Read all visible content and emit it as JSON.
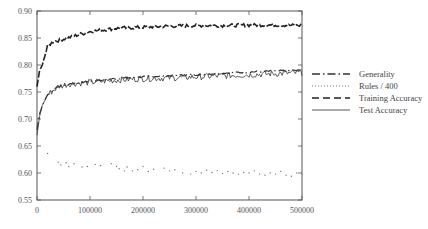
{
  "chart_data": {
    "type": "line",
    "title": "",
    "xlabel": "",
    "ylabel": "",
    "xlim": [
      0,
      500000
    ],
    "ylim": [
      0.55,
      0.9
    ],
    "grid": false,
    "legend_position": "right-outside",
    "x_ticks": [
      0,
      100000,
      200000,
      300000,
      400000,
      500000
    ],
    "x_tick_labels": [
      "0",
      "100000",
      "200000",
      "300000",
      "400000",
      "500000"
    ],
    "y_ticks": [
      0.55,
      0.6,
      0.65,
      0.7,
      0.75,
      0.8,
      0.85,
      0.9
    ],
    "y_tick_labels": [
      "0.55",
      "0.60",
      "0.65",
      "0.70",
      "0.75",
      "0.80",
      "0.85",
      "0.90"
    ],
    "series": [
      {
        "name": "Generality",
        "style": "dash-dot",
        "x": [
          0,
          5000,
          10000,
          20000,
          40000,
          60000,
          100000,
          150000,
          200000,
          250000,
          300000,
          350000,
          400000,
          450000,
          500000
        ],
        "values": [
          0.68,
          0.71,
          0.725,
          0.745,
          0.76,
          0.765,
          0.77,
          0.775,
          0.778,
          0.78,
          0.782,
          0.785,
          0.787,
          0.789,
          0.79
        ]
      },
      {
        "name": "Rules / 400",
        "style": "dotted",
        "x": [
          20000,
          40000,
          45000,
          55000,
          60000,
          70000,
          85000,
          95000,
          110000,
          120000,
          140000,
          150000,
          155000,
          165000,
          170000,
          180000,
          190000,
          200000,
          210000,
          220000,
          240000,
          250000,
          260000,
          275000,
          290000,
          300000,
          310000,
          320000,
          330000,
          340000,
          350000,
          360000,
          370000,
          380000,
          390000,
          400000,
          410000,
          420000,
          430000,
          440000,
          450000,
          460000,
          470000,
          480000,
          490000,
          500000
        ],
        "values": [
          0.636,
          0.62,
          0.615,
          0.619,
          0.612,
          0.617,
          0.611,
          0.612,
          0.616,
          0.614,
          0.617,
          0.612,
          0.608,
          0.604,
          0.611,
          0.604,
          0.606,
          0.612,
          0.603,
          0.607,
          0.609,
          0.604,
          0.606,
          0.6,
          0.598,
          0.603,
          0.6,
          0.605,
          0.601,
          0.604,
          0.599,
          0.603,
          0.6,
          0.598,
          0.601,
          0.6,
          0.604,
          0.598,
          0.596,
          0.6,
          0.598,
          0.603,
          0.596,
          0.594,
          0.6,
          0.598
        ]
      },
      {
        "name": "Training Accuracy",
        "style": "long-dash",
        "x": [
          0,
          5000,
          10000,
          20000,
          30000,
          50000,
          75000,
          100000,
          150000,
          200000,
          250000,
          300000,
          350000,
          400000,
          450000,
          500000
        ],
        "values": [
          0.76,
          0.79,
          0.8,
          0.835,
          0.843,
          0.848,
          0.855,
          0.862,
          0.868,
          0.87,
          0.872,
          0.873,
          0.873,
          0.874,
          0.874,
          0.873
        ]
      },
      {
        "name": "Test Accuracy",
        "style": "solid",
        "x": [
          0,
          5000,
          10000,
          20000,
          40000,
          60000,
          100000,
          150000,
          200000,
          250000,
          300000,
          350000,
          400000,
          450000,
          500000
        ],
        "values": [
          0.67,
          0.705,
          0.725,
          0.745,
          0.76,
          0.765,
          0.768,
          0.772,
          0.775,
          0.776,
          0.778,
          0.78,
          0.782,
          0.784,
          0.786
        ]
      }
    ]
  },
  "legend": {
    "items": [
      {
        "label": "Generality"
      },
      {
        "label": "Rules / 400"
      },
      {
        "label": "Training Accuracy"
      },
      {
        "label": "Test Accuracy"
      }
    ]
  }
}
